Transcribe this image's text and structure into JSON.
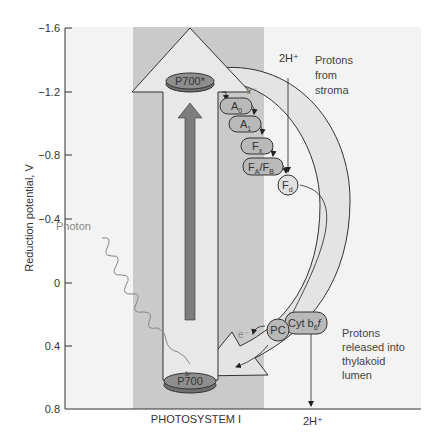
{
  "axis": {
    "title": "Reduction potential, V",
    "ticks": [
      "−1.6",
      "−1.2",
      "−0.8",
      "−0.4",
      "0",
      "0.4",
      "0.8"
    ]
  },
  "photosystem": {
    "label": "PHOTOSYSTEM I",
    "p700_excited": "P700*",
    "p700_ground": "P700"
  },
  "photon": {
    "label": "Photon"
  },
  "electron_labels": {
    "top": "e⁻",
    "bottom": "e⁻"
  },
  "carriers": [
    {
      "main": "A",
      "sub": "0"
    },
    {
      "main": "A",
      "sub": "1"
    },
    {
      "main": "F",
      "sub": "x"
    },
    {
      "main": "F",
      "sub": "A",
      "main2": "/F",
      "sub2": "B"
    },
    {
      "main": "F",
      "sub": "d"
    },
    {
      "main": "Cyt b",
      "sub": "6",
      "suffix": "f"
    },
    {
      "main": "PC"
    }
  ],
  "protons": {
    "top_label": "2H⁺",
    "top_note_lines": [
      "Protons",
      "from",
      "stroma"
    ],
    "bottom_label": "2H⁺",
    "bottom_note_lines": [
      "Protons",
      "released into",
      "thylakoid",
      "lumen"
    ]
  },
  "colors": {
    "background_panel": "#f2f2f2",
    "photosystem_band": "#c9c9c9",
    "arrow_fill": "#e6e6e6",
    "carrier_fill": "#b8b8b8",
    "p700_fill": "#8c8c8c",
    "inner_arrow": "#7a7a7a",
    "line": "#333333",
    "photon_line": "#888888"
  }
}
